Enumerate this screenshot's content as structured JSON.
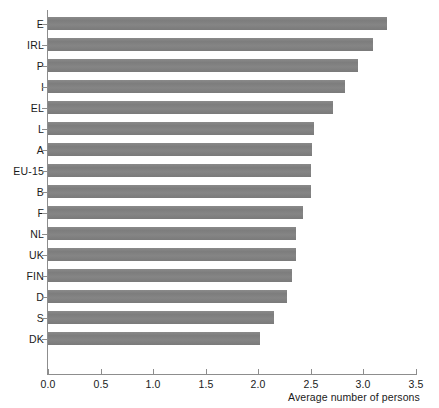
{
  "chart_data": {
    "type": "bar",
    "orientation": "horizontal",
    "title": "",
    "xlabel": "Average number of persons",
    "ylabel": "",
    "xlim": [
      0.0,
      3.5
    ],
    "xticks": [
      "0.0",
      "0.5",
      "1.0",
      "1.5",
      "2.0",
      "2.5",
      "3.0",
      "3.5"
    ],
    "grid": false,
    "legend": null,
    "bar_color": "#828282",
    "axis_color": "#8d8d8d",
    "categories": [
      "E",
      "IRL",
      "P",
      "I",
      "EL",
      "L",
      "A",
      "EU-15",
      "B",
      "F",
      "NL",
      "UK",
      "FIN",
      "D",
      "S",
      "DK"
    ],
    "values": [
      3.22,
      3.09,
      2.95,
      2.82,
      2.71,
      2.53,
      2.51,
      2.5,
      2.5,
      2.43,
      2.36,
      2.36,
      2.32,
      2.27,
      2.15,
      2.02
    ]
  }
}
